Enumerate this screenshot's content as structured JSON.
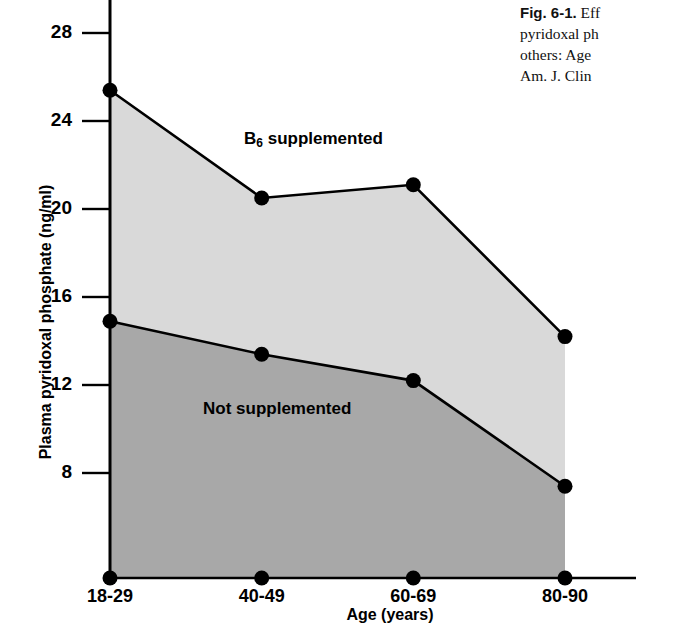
{
  "caption": {
    "figure_number": "Fig. 6-1.",
    "lines": [
      "Eff",
      "pyridoxal ph",
      "others: Age",
      "Am. J. Clin"
    ],
    "line1_rest": " Eff",
    "line2": "pyridoxal ph",
    "line3": "others: Age",
    "line4": "Am. J. Clin"
  },
  "chart_data": {
    "type": "line",
    "title": "",
    "xlabel": "Age (years)",
    "ylabel": "Plasma pyridoxal phosphate (ng/ml)",
    "categories": [
      "18-29",
      "40-49",
      "60-69",
      "80-90"
    ],
    "ylim": [
      0,
      29.5
    ],
    "yticks": [
      8,
      12,
      16,
      20,
      24,
      28
    ],
    "ytick_labels": [
      "8",
      "12",
      "16",
      "20",
      "24",
      "28"
    ],
    "grid": false,
    "legend_position": "in-plot annotations",
    "series": [
      {
        "name": "B6 supplemented",
        "label_html": "B<sub>6</sub> supplemented",
        "values": [
          25.4,
          20.5,
          21.1,
          14.2
        ],
        "fill_color": "#d9d9d9",
        "line_color": "#000000",
        "marker": "filled-circle"
      },
      {
        "name": "Not supplemented",
        "label_html": "Not supplemented",
        "values": [
          14.9,
          13.4,
          12.2,
          7.4
        ],
        "fill_color": "#a8a8a8",
        "line_color": "#000000",
        "marker": "filled-circle"
      }
    ],
    "baseline_values": [
      0,
      0,
      0,
      0
    ],
    "axis_color": "#000000"
  }
}
